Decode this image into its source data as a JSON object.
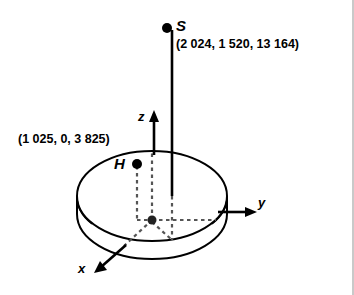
{
  "figure": {
    "type": "3d-coordinate-diagram",
    "background_color": "#ffffff",
    "stroke_color": "#000000",
    "dashed_color": "#555555",
    "axes": {
      "x_label": "x",
      "y_label": "y",
      "z_label": "z"
    },
    "points": [
      {
        "name": "S",
        "label": "S",
        "coordinates_text": "(2 024, 1 520, 13 164)",
        "x": 2024,
        "y": 1520,
        "z": 13164
      },
      {
        "name": "H",
        "label": "H",
        "coordinates_text": "(1 025, 0, 3 825)",
        "x": 1025,
        "y": 0,
        "z": 3825
      },
      {
        "name": "origin",
        "label": "",
        "coordinates_text": "",
        "x": 0,
        "y": 0,
        "z": 0
      }
    ],
    "solid_shape": "cylinder"
  }
}
